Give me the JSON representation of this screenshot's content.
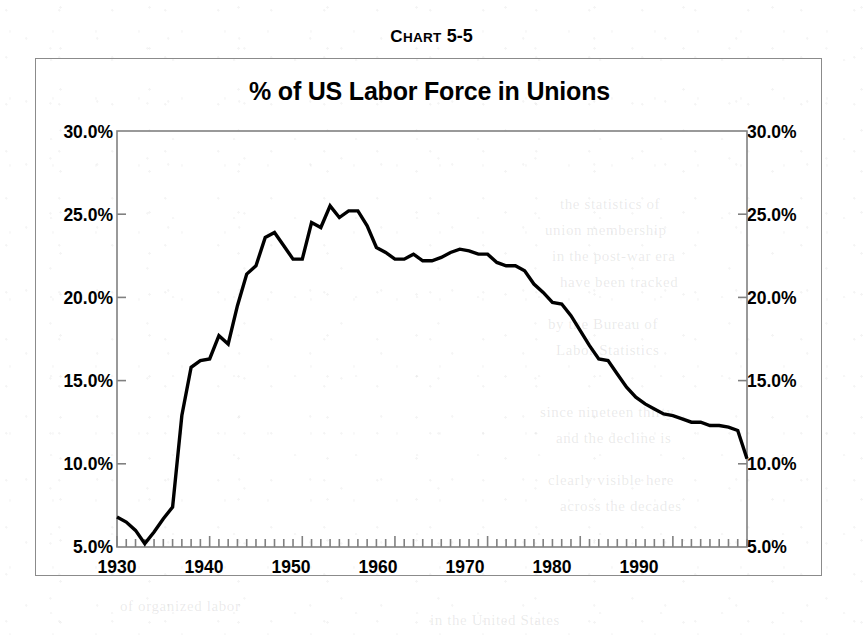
{
  "caption": {
    "prefix_first": "C",
    "prefix_rest": "HART",
    "number": "5-5",
    "full": "Chart 5-5"
  },
  "chart": {
    "title": "% of US Labor Force in Unions",
    "line_color": "#000000",
    "frame_color": "#8b8b8b",
    "axis_color": "#808080"
  },
  "axes": {
    "y_left_labels": [
      "30.0%",
      "25.0%",
      "20.0%",
      "15.0%",
      "10.0%",
      "5.0%"
    ],
    "y_right_labels": [
      "30.0%",
      "25.0%",
      "20.0%",
      "15.0%",
      "10.0%",
      "5.0%"
    ],
    "x_labels": [
      "1930",
      "1940",
      "1950",
      "1960",
      "1970",
      "1980",
      "1990"
    ]
  },
  "ghost": {
    "l1": "the statistics of",
    "l2": "union membership",
    "l3": "in the post-war era",
    "l4": "have been tracked",
    "l5": "by the Bureau of",
    "l6": "Labor Statistics",
    "l7": "since nineteen thirty",
    "l8": "and the decline is",
    "l9": "clearly visible here",
    "l10": "across the decades",
    "l11": "of organized labor",
    "l12": "in the United States"
  },
  "chart_data": {
    "type": "line",
    "title": "% of US Labor Force in Unions",
    "xlabel": "",
    "ylabel": "",
    "xlim": [
      1930,
      1998
    ],
    "ylim": [
      5.0,
      30.0
    ],
    "y_unit": "%",
    "y_ticks": [
      5.0,
      10.0,
      15.0,
      20.0,
      25.0,
      30.0
    ],
    "x_ticks_major": [
      1930,
      1940,
      1950,
      1960,
      1970,
      1980,
      1990
    ],
    "x_tick_interval_minor": 1,
    "grid": false,
    "legend": false,
    "series": [
      {
        "name": "% of US Labor Force in Unions",
        "x": [
          1930,
          1931,
          1932,
          1933,
          1934,
          1935,
          1936,
          1937,
          1938,
          1939,
          1940,
          1941,
          1942,
          1943,
          1944,
          1945,
          1946,
          1947,
          1948,
          1949,
          1950,
          1951,
          1952,
          1953,
          1954,
          1955,
          1956,
          1957,
          1958,
          1959,
          1960,
          1961,
          1962,
          1963,
          1964,
          1965,
          1966,
          1967,
          1968,
          1969,
          1970,
          1971,
          1972,
          1973,
          1974,
          1975,
          1976,
          1977,
          1978,
          1979,
          1980,
          1981,
          1982,
          1983,
          1984,
          1985,
          1986,
          1987,
          1988,
          1989,
          1990,
          1991,
          1992,
          1993,
          1994,
          1995,
          1996,
          1997,
          1998
        ],
        "y": [
          6.8,
          6.5,
          6.0,
          5.2,
          5.9,
          6.7,
          7.4,
          12.9,
          15.8,
          16.2,
          16.3,
          17.7,
          17.2,
          19.5,
          21.4,
          21.9,
          23.6,
          23.9,
          23.1,
          22.3,
          22.3,
          24.5,
          24.2,
          25.5,
          24.8,
          25.2,
          25.2,
          24.3,
          23.0,
          22.7,
          22.3,
          22.3,
          22.6,
          22.2,
          22.2,
          22.4,
          22.7,
          22.9,
          22.8,
          22.6,
          22.6,
          22.1,
          21.9,
          21.9,
          21.6,
          20.8,
          20.3,
          19.7,
          19.6,
          18.9,
          18.0,
          17.1,
          16.3,
          16.2,
          15.4,
          14.6,
          14.0,
          13.6,
          13.3,
          13.0,
          12.9,
          12.7,
          12.5,
          12.5,
          12.3,
          12.3,
          12.2,
          12.0,
          10.3
        ]
      }
    ]
  }
}
